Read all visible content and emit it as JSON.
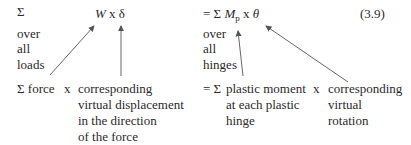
{
  "equation": {
    "number": "(3.9)",
    "left": {
      "sigma": "Σ",
      "over_lines": [
        "over",
        "all",
        "loads"
      ],
      "term_W": "W",
      "times": "x",
      "term_delta": "δ"
    },
    "right": {
      "equals_sigma": "= Σ",
      "term_M": "M",
      "term_M_sub": "p",
      "times": "x",
      "term_theta": "θ",
      "over_lines": [
        "over",
        "all",
        "hinges"
      ]
    }
  },
  "explanation": {
    "left": {
      "sum_force": "Σ force",
      "times": "x",
      "desc_lines": [
        "corresponding",
        "virtual displacement",
        "in the direction",
        "of the force"
      ]
    },
    "right": {
      "equals_sigma": "= Σ",
      "moment_lines": [
        "plastic moment",
        "at each plastic",
        "hinge"
      ],
      "times": "x",
      "rotation_lines": [
        "corresponding",
        "virtual",
        "rotation"
      ]
    }
  },
  "colors": {
    "text": "#2a2a2a",
    "arrow": "#555555"
  }
}
